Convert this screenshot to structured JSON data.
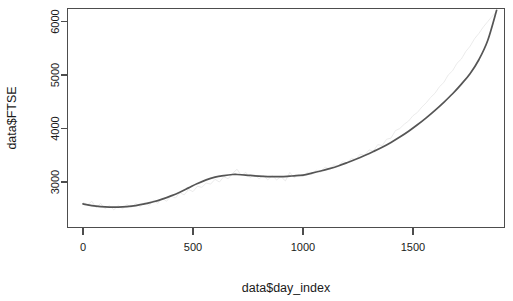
{
  "chart_data": {
    "type": "line",
    "title": "",
    "subtitle": "",
    "xlabel": "data$day_index",
    "ylabel": "data$FTSE",
    "xlim": [
      0,
      1900
    ],
    "ylim": [
      2450,
      6280
    ],
    "grid": false,
    "legend": null,
    "x_ticks": [
      0,
      500,
      1000,
      1500
    ],
    "x_tick_labels": [
      "0",
      "500",
      "1000",
      "1500"
    ],
    "y_ticks": [
      3000,
      4000,
      5000,
      6000
    ],
    "y_tick_labels": [
      "3000",
      "4000",
      "5000",
      "6000"
    ],
    "series": [
      {
        "name": "data$FTSE",
        "role": "raw-observations",
        "type": "line",
        "color": "#e2e2e2",
        "width": 0.7,
        "x": [
          0,
          20,
          40,
          60,
          80,
          100,
          120,
          140,
          160,
          180,
          200,
          220,
          240,
          260,
          280,
          300,
          320,
          340,
          360,
          380,
          400,
          420,
          440,
          460,
          480,
          500,
          520,
          540,
          560,
          580,
          600,
          620,
          640,
          660,
          680,
          700,
          720,
          740,
          760,
          780,
          800,
          820,
          840,
          860,
          880,
          900,
          920,
          940,
          960,
          980,
          1000,
          1020,
          1040,
          1060,
          1080,
          1100,
          1120,
          1140,
          1160,
          1180,
          1200,
          1220,
          1240,
          1260,
          1280,
          1300,
          1320,
          1340,
          1360,
          1380,
          1400,
          1420,
          1440,
          1460,
          1480,
          1500,
          1520,
          1540,
          1560,
          1580,
          1600,
          1620,
          1640,
          1660,
          1680,
          1700,
          1720,
          1740,
          1760,
          1780,
          1800,
          1820,
          1840,
          1860,
          1880
        ],
        "y": [
          2620,
          2570,
          2640,
          2520,
          2600,
          2500,
          2560,
          2480,
          2560,
          2500,
          2580,
          2520,
          2600,
          2540,
          2620,
          2560,
          2660,
          2600,
          2700,
          2640,
          2740,
          2700,
          2800,
          2760,
          2860,
          2820,
          2920,
          2900,
          2980,
          2960,
          3050,
          3000,
          3100,
          3060,
          3160,
          3240,
          3120,
          3180,
          3080,
          3140,
          3060,
          3120,
          3040,
          3120,
          3040,
          3100,
          3020,
          3180,
          3080,
          3140,
          3100,
          3180,
          3140,
          3220,
          3180,
          3280,
          3240,
          3320,
          3300,
          3380,
          3360,
          3440,
          3420,
          3520,
          3500,
          3600,
          3580,
          3700,
          3680,
          3800,
          3820,
          3960,
          4000,
          4080,
          4140,
          4240,
          4300,
          4400,
          4480,
          4580,
          4660,
          4780,
          4860,
          5000,
          5080,
          5220,
          5300,
          5440,
          5540,
          5680,
          5780,
          5900,
          6000,
          6100,
          6180
        ]
      },
      {
        "name": "loess smooth",
        "role": "smoothed-trend",
        "type": "line",
        "color": "#555555",
        "width": 1.7,
        "x": [
          0,
          40,
          80,
          120,
          160,
          200,
          240,
          280,
          320,
          360,
          400,
          440,
          480,
          520,
          560,
          600,
          640,
          680,
          700,
          740,
          780,
          820,
          860,
          900,
          940,
          960,
          1000,
          1040,
          1080,
          1120,
          1160,
          1200,
          1240,
          1280,
          1320,
          1360,
          1400,
          1440,
          1480,
          1520,
          1560,
          1600,
          1640,
          1680,
          1720,
          1760,
          1800,
          1840,
          1880
        ],
        "y": [
          2590,
          2560,
          2540,
          2530,
          2530,
          2540,
          2560,
          2590,
          2630,
          2680,
          2740,
          2810,
          2890,
          2970,
          3040,
          3090,
          3120,
          3140,
          3140,
          3130,
          3115,
          3105,
          3100,
          3100,
          3110,
          3115,
          3130,
          3165,
          3205,
          3250,
          3300,
          3360,
          3425,
          3495,
          3570,
          3650,
          3740,
          3840,
          3950,
          4070,
          4200,
          4340,
          4490,
          4650,
          4830,
          5030,
          5290,
          5650,
          6210
        ]
      }
    ]
  },
  "axes": {
    "x_title": "data$day_index",
    "y_title": "data$FTSE"
  }
}
